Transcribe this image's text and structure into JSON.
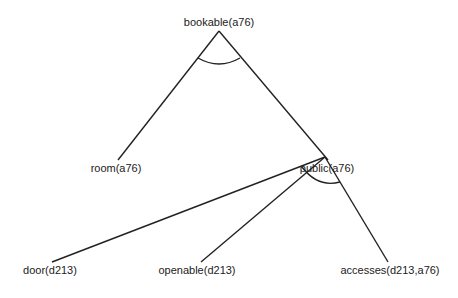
{
  "diagram": {
    "type": "and-tree",
    "nodes": [
      {
        "id": "bookable",
        "label": "bookable(a76)"
      },
      {
        "id": "room",
        "label": "room(a76)"
      },
      {
        "id": "public",
        "label": "public(a76)"
      },
      {
        "id": "door",
        "label": "door(d213)"
      },
      {
        "id": "openable",
        "label": "openable(d213)"
      },
      {
        "id": "accesses",
        "label": "accesses(d213,a76)"
      }
    ],
    "edges": [
      {
        "from": "bookable",
        "to": "room"
      },
      {
        "from": "bookable",
        "to": "public"
      },
      {
        "from": "public",
        "to": "door"
      },
      {
        "from": "public",
        "to": "openable"
      },
      {
        "from": "public",
        "to": "accesses"
      }
    ],
    "and_arcs": [
      "bookable",
      "public"
    ]
  }
}
